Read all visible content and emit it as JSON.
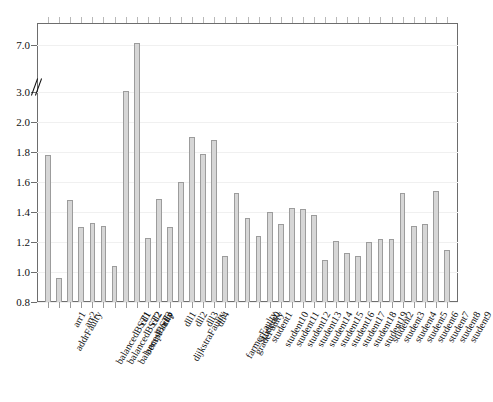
{
  "chart_data": {
    "type": "bar",
    "title": "",
    "subtitle": "",
    "xlabel": "",
    "ylabel": "",
    "ylim": [
      0.8,
      7.6
    ],
    "grid": true,
    "legend": null,
    "axis_break": {
      "present": true,
      "between": [
        2.0,
        3.0
      ],
      "label": "3.0"
    },
    "ytick_labels": [
      "0.8",
      "1.0",
      "1.2",
      "1.4",
      "1.6",
      "1.8",
      "2.0",
      "3.0",
      "7.0"
    ],
    "ytick_values": [
      0.8,
      1.0,
      1.2,
      1.4,
      1.6,
      1.8,
      2.0,
      3.0,
      7.0
    ],
    "categories": [
      "addrFaulty",
      "arr1",
      "arr2",
      "balancedBST1",
      "balancedBST2",
      "balancedBST3",
      "bempFaulty",
      "cd1",
      "cd2",
      "cdp",
      "dijkstraFaulty",
      "dll1",
      "dll2",
      "dll3",
      "dll4",
      "farmerFaulty",
      "gradeFaulty",
      "student0",
      "student1",
      "student10",
      "student11",
      "student12",
      "student13",
      "student14",
      "student15",
      "student16",
      "student17",
      "student18",
      "student19",
      "student2",
      "student3",
      "student4",
      "student5",
      "student6",
      "student7",
      "student8",
      "student9"
    ],
    "values": [
      1.78,
      0.96,
      1.48,
      1.3,
      1.33,
      1.31,
      1.04,
      3.1,
      7.2,
      1.23,
      1.49,
      1.3,
      1.6,
      1.9,
      1.79,
      1.88,
      1.11,
      1.53,
      1.36,
      1.24,
      1.4,
      1.32,
      1.43,
      1.42,
      1.38,
      1.08,
      1.21,
      1.13,
      1.11,
      1.2,
      1.22,
      1.22,
      1.53,
      1.31,
      1.32,
      1.54,
      1.15
    ]
  }
}
